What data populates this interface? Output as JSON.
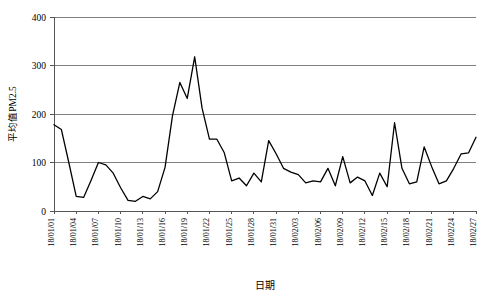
{
  "chart_data": {
    "type": "line",
    "title": "",
    "xlabel": "日期",
    "ylabel": "平均值PM2.5",
    "ylim": [
      0,
      400
    ],
    "yticks": [
      0,
      100,
      200,
      300,
      400
    ],
    "ytick_labels": [
      "0",
      "100",
      "200",
      "300",
      "400"
    ],
    "grid": true,
    "legend": "none",
    "x_tick_labels": [
      "18/01/01",
      "18/01/04",
      "18/01/07",
      "18/01/10",
      "18/01/13",
      "18/01/16",
      "18/01/19",
      "18/01/22",
      "18/01/25",
      "18/01/28",
      "18/01/31",
      "18/02/03",
      "18/02/06",
      "18/02/09",
      "18/02/12",
      "18/02/15",
      "18/02/18",
      "18/02/21",
      "18/02/24",
      "18/02/27"
    ],
    "x_tick_interval_days": 3,
    "x": [
      "18/01/01",
      "18/01/02",
      "18/01/03",
      "18/01/04",
      "18/01/05",
      "18/01/06",
      "18/01/07",
      "18/01/08",
      "18/01/09",
      "18/01/10",
      "18/01/11",
      "18/01/12",
      "18/01/13",
      "18/01/14",
      "18/01/15",
      "18/01/16",
      "18/01/17",
      "18/01/18",
      "18/01/19",
      "18/01/20",
      "18/01/21",
      "18/01/22",
      "18/01/23",
      "18/01/24",
      "18/01/25",
      "18/01/26",
      "18/01/27",
      "18/01/28",
      "18/01/29",
      "18/01/30",
      "18/01/31",
      "18/02/01",
      "18/02/02",
      "18/02/03",
      "18/02/04",
      "18/02/05",
      "18/02/06",
      "18/02/07",
      "18/02/08",
      "18/02/09",
      "18/02/10",
      "18/02/11",
      "18/02/12",
      "18/02/13",
      "18/02/14",
      "18/02/15",
      "18/02/16",
      "18/02/17",
      "18/02/18",
      "18/02/19",
      "18/02/20",
      "18/02/21",
      "18/02/22",
      "18/02/23",
      "18/02/24",
      "18/02/25",
      "18/02/26",
      "18/02/27"
    ],
    "values": [
      178,
      168,
      100,
      30,
      28,
      63,
      100,
      95,
      78,
      48,
      22,
      20,
      30,
      25,
      40,
      90,
      196,
      265,
      232,
      318,
      212,
      148,
      148,
      120,
      62,
      68,
      52,
      78,
      60,
      145,
      118,
      88,
      80,
      75,
      58,
      62,
      60,
      88,
      52,
      112,
      58,
      70,
      62,
      32,
      78,
      50,
      182,
      88,
      56,
      60,
      132,
      92,
      56,
      62,
      88,
      118,
      120,
      152
    ],
    "series_name": "平均值PM2.5",
    "n_points": 58,
    "min_value": 20,
    "max_value": 318,
    "line_color": "#000000",
    "grid_color": "#808080",
    "background": "#ffffff"
  }
}
